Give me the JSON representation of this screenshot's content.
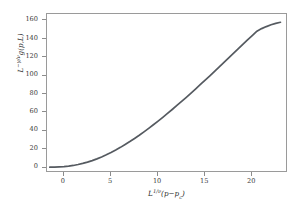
{
  "chart_data": {
    "type": "line",
    "title": "",
    "subtitle": "",
    "xlabel": "L^(1/v)(p - p_c)",
    "ylabel": "L^(-g/v) g(p,L)",
    "xlabel_parts": {
      "base": "L",
      "exponent": "1/v",
      "rest": "(p − p",
      "sub": "c",
      "close": ")"
    },
    "ylabel_parts": {
      "base": "L",
      "exponent": "−γ/ν",
      "rest": "g(p, L)"
    },
    "xlim": [
      -1.8,
      23.8
    ],
    "ylim": [
      -6,
      167
    ],
    "xticks": [
      0,
      5,
      10,
      15,
      20
    ],
    "yticks": [
      0,
      20,
      40,
      60,
      80,
      100,
      120,
      140,
      160
    ],
    "grid": false,
    "legend": "none",
    "line_color": "#555a60",
    "frame_color": "#9a9a9a",
    "background": "#ffffff",
    "series": [
      {
        "name": "collapsed-scaling-curve",
        "x": [
          -1.5,
          -1.0,
          -0.5,
          0.0,
          0.5,
          1.0,
          1.5,
          2.0,
          2.5,
          3.0,
          3.5,
          4.0,
          4.5,
          5.0,
          5.5,
          6.0,
          6.5,
          7.0,
          7.5,
          8.0,
          8.5,
          9.0,
          9.5,
          10.0,
          10.5,
          11.0,
          11.5,
          12.0,
          12.5,
          13.0,
          13.5,
          14.0,
          14.5,
          15.0,
          15.5,
          16.0,
          16.5,
          17.0,
          17.5,
          18.0,
          18.5,
          19.0,
          19.5,
          20.0,
          20.5,
          21.0,
          21.5,
          22.0,
          22.5,
          23.0
        ],
        "y": [
          0.4,
          0.5,
          0.7,
          1.0,
          1.5,
          2.2,
          3.2,
          4.4,
          5.8,
          7.5,
          9.4,
          11.5,
          13.8,
          16.3,
          19.0,
          21.9,
          25.0,
          28.2,
          31.6,
          35.1,
          38.8,
          42.6,
          46.5,
          50.5,
          54.6,
          58.8,
          63.1,
          67.5,
          71.9,
          76.4,
          81.0,
          85.6,
          90.3,
          95.0,
          99.8,
          104.6,
          109.4,
          114.3,
          119.2,
          124.1,
          129.0,
          133.9,
          138.8,
          143.6,
          148.3,
          151.1,
          153.3,
          155.3,
          156.8,
          158.0
        ]
      }
    ]
  }
}
